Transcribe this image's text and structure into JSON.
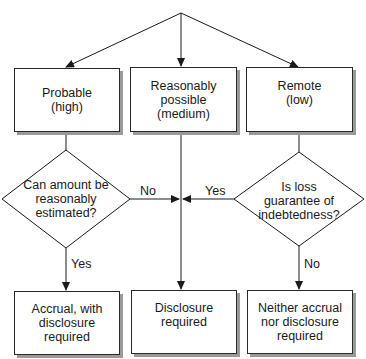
{
  "diagram": {
    "type": "flowchart",
    "colors": {
      "line": "#1a1a1a",
      "box_fill": "#ffffff",
      "shadow": "#9a9a9a"
    },
    "likelihood_boxes": [
      {
        "id": "probable",
        "label": "Probable\n(high)"
      },
      {
        "id": "reasonably-possible",
        "label": "Reasonably\npossible\n(medium)"
      },
      {
        "id": "remote",
        "label": "Remote\n(low)"
      }
    ],
    "decisions": [
      {
        "id": "estimable",
        "label": "Can amount be\nreasonably\nestimated?"
      },
      {
        "id": "guarantee",
        "label": "Is loss\nguarantee of\nindebtedness?"
      }
    ],
    "outcome_boxes": [
      {
        "id": "accrual",
        "label": "Accrual, with\ndisclosure\nrequired"
      },
      {
        "id": "disclosure",
        "label": "Disclosure\nrequired"
      },
      {
        "id": "neither",
        "label": "Neither accrual\nnor disclosure\nrequired"
      }
    ],
    "edge_labels": {
      "estimable_no": "No",
      "estimable_yes": "Yes",
      "guarantee_yes": "Yes",
      "guarantee_no": "No"
    }
  }
}
